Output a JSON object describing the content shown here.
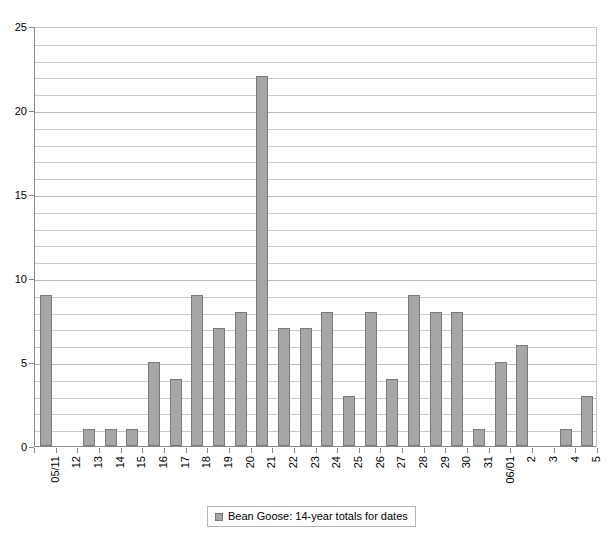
{
  "chart_data": {
    "type": "bar",
    "title": "",
    "subtitle": "",
    "xlabel": "",
    "ylabel": "",
    "ylim": [
      0,
      25
    ],
    "ytick_step": 5,
    "gridline_step": 1,
    "grid": true,
    "legend_position": "bottom",
    "legend": [
      "Bean Goose: 14-year totals for dates"
    ],
    "series_color": "#a6a6a6",
    "categories": [
      "05/11",
      "12",
      "13",
      "14",
      "15",
      "16",
      "17",
      "18",
      "19",
      "20",
      "21",
      "22",
      "23",
      "24",
      "25",
      "26",
      "27",
      "28",
      "29",
      "30",
      "31",
      "06/01",
      "2",
      "3",
      "4",
      "5"
    ],
    "values": [
      9,
      0,
      1,
      1,
      1,
      5,
      4,
      9,
      7,
      8,
      22,
      7,
      7,
      8,
      3,
      8,
      4,
      9,
      8,
      8,
      1,
      5,
      6,
      0,
      1,
      3
    ],
    "series": [
      {
        "name": "Bean Goose: 14-year totals for dates",
        "values": [
          9,
          0,
          1,
          1,
          1,
          5,
          4,
          9,
          7,
          8,
          22,
          7,
          7,
          8,
          3,
          8,
          4,
          9,
          8,
          8,
          1,
          5,
          6,
          0,
          1,
          3
        ]
      }
    ],
    "ytick_labels": [
      "0",
      "5",
      "10",
      "15",
      "20",
      "25"
    ],
    "ytick_values": [
      0,
      5,
      10,
      15,
      20,
      25
    ]
  },
  "legend": {
    "entry_label": "Bean Goose: 14-year totals for dates"
  },
  "colors": {
    "bar_fill": "#a6a6a6",
    "bar_stroke": "#7a7a7a",
    "gridline": "#c9c9c9",
    "axis": "#8a8a8a",
    "background": "#ffffff"
  }
}
